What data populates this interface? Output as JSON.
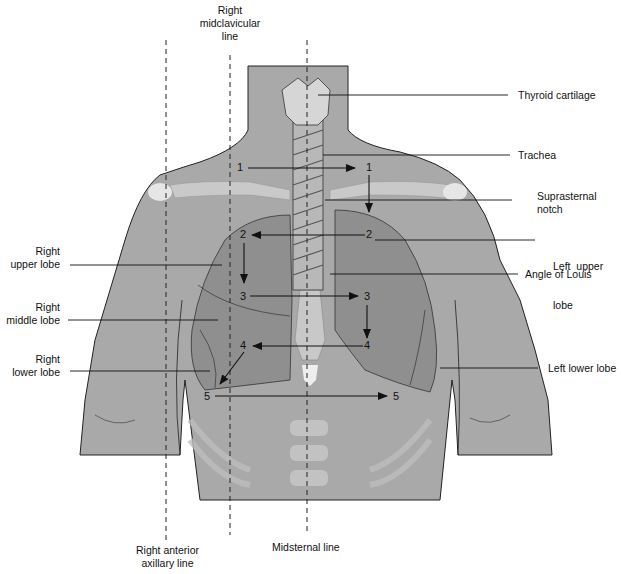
{
  "colors": {
    "background": "#ffffff",
    "body": "#a9a9a9",
    "lung": "#8f8f8f",
    "bone": "#c8c8c8",
    "outline": "#222222",
    "arrow": "#111111"
  },
  "labels": {
    "right_midclavicular": [
      "Right",
      "midclavicular",
      "line"
    ],
    "thyroid_cartilage": "Thyroid cartilage",
    "trachea": "Trachea",
    "suprasternal_notch": [
      "Suprasternal",
      "notch"
    ],
    "left_upper_lobe": [
      "Left  upper",
      "lobe"
    ],
    "angle_of_louis": "Angle of Louis",
    "right_upper_lobe": [
      "Right",
      "upper lobe"
    ],
    "right_middle_lobe": [
      "Right",
      "middle lobe"
    ],
    "right_lower_lobe": [
      "Right",
      "lower lobe"
    ],
    "left_lower_lobe": "Left lower lobe",
    "right_anterior_axillary": [
      "Right anterior",
      "axillary line"
    ],
    "midsternal": "Midsternal line"
  },
  "auscultation_points": {
    "right": [
      "1",
      "2",
      "3",
      "4",
      "5"
    ],
    "left": [
      "1",
      "2",
      "3",
      "4",
      "5"
    ]
  },
  "sequence_description": "Auscultation sequence: 1 right to 1 left, down to 2 left, across to 2 right, down to 3 right, across to 3 left, down to 4 left, across to 4 right, down to 5 right, across to 5 left"
}
